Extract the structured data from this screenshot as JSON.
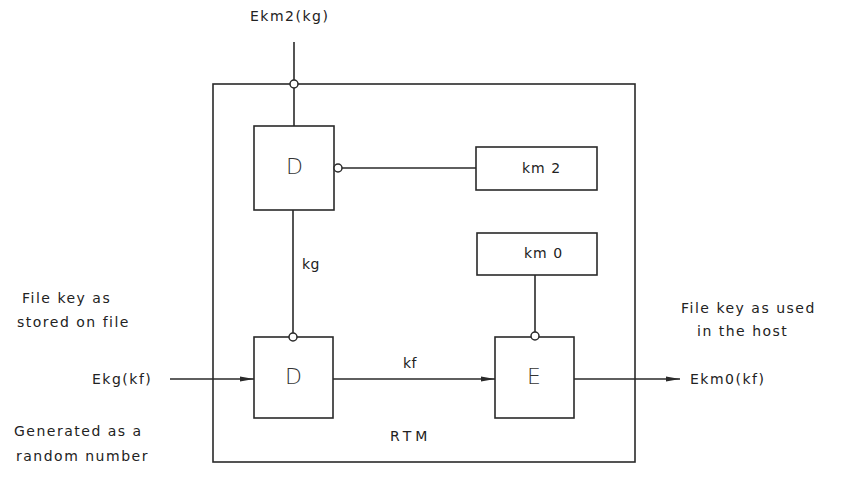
{
  "diagram": {
    "container_label": "RTM",
    "top_input_label": "Ekm2(kg)",
    "blocks": {
      "decrypt_top": "D",
      "decrypt_bottom": "D",
      "encrypt": "E",
      "key_km2": "km 2",
      "key_km0": "km 0"
    },
    "signals": {
      "kg": "kg",
      "kf": "kf"
    },
    "left_input": {
      "label": "Ekg(kf)",
      "note_above_line1": "File key as",
      "note_above_line2": "stored on file",
      "note_below_line1": "Generated as a",
      "note_below_line2": "random number"
    },
    "right_output": {
      "label": "Ekm0(kf)",
      "note_line1": "File key as used",
      "note_line2": "in the host"
    },
    "colors": {
      "line": "#2a2a2a",
      "background": "#ffffff"
    }
  }
}
